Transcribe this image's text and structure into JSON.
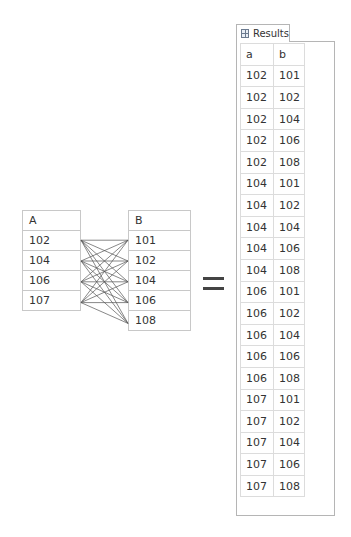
{
  "table_a": {
    "header": "A",
    "rows": [
      "102",
      "104",
      "106",
      "107"
    ]
  },
  "table_b": {
    "header": "B",
    "rows": [
      "101",
      "102",
      "104",
      "106",
      "108"
    ]
  },
  "operator": "=",
  "results_panel": {
    "tab_label": "Results",
    "tab_icon": "grid-icon",
    "columns": [
      "a",
      "b"
    ],
    "rows": [
      [
        "102",
        "101"
      ],
      [
        "102",
        "102"
      ],
      [
        "102",
        "104"
      ],
      [
        "102",
        "106"
      ],
      [
        "102",
        "108"
      ],
      [
        "104",
        "101"
      ],
      [
        "104",
        "102"
      ],
      [
        "104",
        "104"
      ],
      [
        "104",
        "106"
      ],
      [
        "104",
        "108"
      ],
      [
        "106",
        "101"
      ],
      [
        "106",
        "102"
      ],
      [
        "106",
        "104"
      ],
      [
        "106",
        "106"
      ],
      [
        "106",
        "108"
      ],
      [
        "107",
        "101"
      ],
      [
        "107",
        "102"
      ],
      [
        "107",
        "104"
      ],
      [
        "107",
        "106"
      ],
      [
        "107",
        "108"
      ]
    ]
  },
  "colors": {
    "border": "#c8c8c8",
    "line": "#555555",
    "operator": "#444444"
  }
}
